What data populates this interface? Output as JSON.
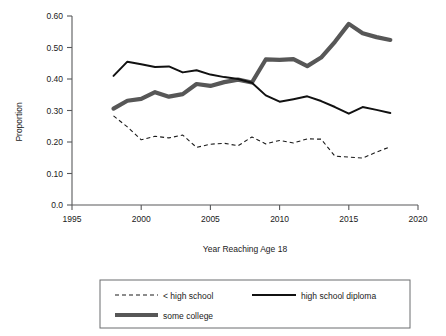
{
  "chart_data": {
    "type": "line",
    "title": "",
    "xlabel": "Year Reaching Age 18",
    "ylabel": "Proportion",
    "xlim": [
      1995,
      2020
    ],
    "ylim": [
      0.0,
      0.6
    ],
    "xticks": [
      "1995",
      "2000",
      "2005",
      "2010",
      "2015",
      "2020"
    ],
    "xtick_values": [
      1995,
      2000,
      2005,
      2010,
      2015,
      2020
    ],
    "yticks": [
      "0.0",
      "0.10",
      "0.20",
      "0.30",
      "0.40",
      "0.50",
      "0.60"
    ],
    "ytick_values": [
      0.0,
      0.1,
      0.2,
      0.3,
      0.4,
      0.5,
      0.6
    ],
    "grid": false,
    "legend_position": "bottom",
    "x": [
      1998,
      1999,
      2000,
      2001,
      2002,
      2003,
      2004,
      2005,
      2006,
      2007,
      2008,
      2009,
      2010,
      2011,
      2012,
      2013,
      2014,
      2015,
      2016,
      2017,
      2018
    ],
    "series": [
      {
        "name": "< high school",
        "style": "dashed",
        "color": "#1a1a1a",
        "values": [
          0.283,
          0.248,
          0.207,
          0.218,
          0.213,
          0.222,
          0.183,
          0.193,
          0.196,
          0.188,
          0.216,
          0.194,
          0.205,
          0.197,
          0.21,
          0.209,
          0.155,
          0.152,
          0.149,
          0.168,
          0.185
        ]
      },
      {
        "name": "high school diploma",
        "style": "solid-thin",
        "color": "#111111",
        "values": [
          0.41,
          0.455,
          0.447,
          0.438,
          0.44,
          0.421,
          0.428,
          0.414,
          0.406,
          0.4,
          0.388,
          0.348,
          0.328,
          0.336,
          0.345,
          0.33,
          0.311,
          0.29,
          0.311,
          0.302,
          0.292
        ]
      },
      {
        "name": "some college",
        "style": "solid-thick",
        "color": "#575757",
        "values": [
          0.306,
          0.331,
          0.337,
          0.358,
          0.344,
          0.352,
          0.384,
          0.378,
          0.39,
          0.398,
          0.389,
          0.462,
          0.461,
          0.463,
          0.441,
          0.468,
          0.518,
          0.575,
          0.545,
          0.533,
          0.524
        ]
      }
    ]
  },
  "legend": {
    "items": [
      {
        "label": "< high school",
        "style": "dashed"
      },
      {
        "label": "high school diploma",
        "style": "solid-thin"
      },
      {
        "label": "some college",
        "style": "solid-thick"
      }
    ]
  }
}
